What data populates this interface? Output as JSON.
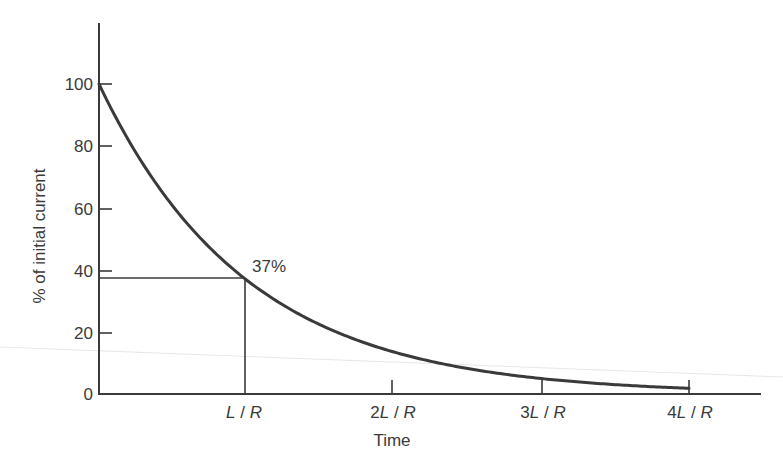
{
  "chart_data": {
    "type": "line",
    "title": "",
    "xlabel": "Time",
    "ylabel": "% of initial current",
    "x_tick_labels": [
      "L / R",
      "2L / R",
      "3L / R",
      "4L / R"
    ],
    "x_ticks": [
      1,
      2,
      3,
      4
    ],
    "y_tick_labels": [
      "0",
      "20",
      "40",
      "60",
      "80",
      "100"
    ],
    "y_ticks": [
      0,
      20,
      40,
      60,
      80,
      100
    ],
    "xlim": [
      0,
      4.5
    ],
    "ylim": [
      0,
      120
    ],
    "grid": false,
    "legend": null,
    "series": [
      {
        "name": "current decay",
        "function": "100 * exp(-t / (L/R))",
        "x": [
          0,
          0.5,
          1,
          1.5,
          2,
          2.5,
          3,
          3.5,
          4
        ],
        "values": [
          100,
          61,
          37,
          22,
          14,
          8,
          5,
          3,
          2
        ]
      }
    ],
    "annotations": [
      {
        "text": "37%",
        "x": 1,
        "y": 37,
        "guide_lines": "horizontal line from y-axis to point and vertical line from point down to x-axis at t = L/R"
      }
    ]
  },
  "labels": {
    "y_axis": "% of initial current",
    "x_axis": "Time",
    "annotation": "37%",
    "yticks": [
      "100",
      "80",
      "60",
      "40",
      "20",
      "0"
    ],
    "xticks": [
      {
        "pre": "",
        "L": "L",
        "sep": " / ",
        "R": "R"
      },
      {
        "pre": "2",
        "L": "L",
        "sep": " / ",
        "R": "R"
      },
      {
        "pre": "3",
        "L": "L",
        "sep": " / ",
        "R": "R"
      },
      {
        "pre": "4",
        "L": "L",
        "sep": " / ",
        "R": "R"
      }
    ]
  },
  "colors": {
    "curve": "#3a3a3a",
    "axis": "#3a3a3a",
    "text": "#3a3a3a",
    "background": "#ffffff"
  }
}
